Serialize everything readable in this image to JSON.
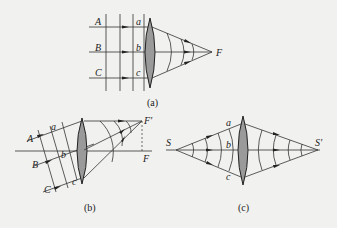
{
  "figure": {
    "panels": [
      {
        "id": "a",
        "caption": "(a)",
        "description": "Plane wavefronts parallel to lens, converging to focal point F",
        "labels": {
          "rays": [
            "A",
            "B",
            "C"
          ],
          "lens_points": [
            "a",
            "b",
            "c"
          ],
          "focus": "F"
        }
      },
      {
        "id": "b",
        "caption": "(b)",
        "description": "Oblique plane wavefronts converging to off-axis focal point F' above F",
        "labels": {
          "rays": [
            "A",
            "B",
            "C"
          ],
          "lens_points": [
            "a",
            "b",
            "c"
          ],
          "focus_offaxis": "F'",
          "focus": "F"
        }
      },
      {
        "id": "c",
        "caption": "(c)",
        "description": "Spherical waves from point source S imaged by lens to point S'",
        "labels": {
          "source": "S",
          "image": "S'",
          "lens_points": [
            "a",
            "b",
            "c"
          ]
        }
      }
    ]
  },
  "colors": {
    "background": "#f1f1ef",
    "lens_fill": "#9a9a9a",
    "line": "#333333"
  }
}
